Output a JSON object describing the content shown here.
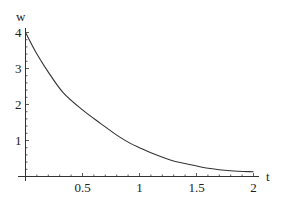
{
  "chart_data": {
    "type": "line",
    "title": "",
    "xlabel": "t",
    "ylabel": "w",
    "xlim": [
      0,
      2
    ],
    "ylim": [
      0,
      4
    ],
    "x_ticks": [
      {
        "value": 0.5,
        "label": "0.5"
      },
      {
        "value": 1,
        "label": "1"
      },
      {
        "value": 1.5,
        "label": "1.5"
      },
      {
        "value": 2,
        "label": "2"
      }
    ],
    "y_ticks": [
      {
        "value": 1,
        "label": "1"
      },
      {
        "value": 2,
        "label": "2"
      },
      {
        "value": 3,
        "label": "3"
      },
      {
        "value": 4,
        "label": "4"
      }
    ],
    "grid": false,
    "legend": null,
    "series": [
      {
        "name": "w(t)",
        "color": "#333333",
        "x": [
          0,
          0.1,
          0.2,
          0.33,
          0.5,
          0.66,
          0.8,
          0.92,
          1.0,
          1.1,
          1.27,
          1.4,
          1.62,
          1.8,
          2.0
        ],
        "y": [
          4.0,
          3.4,
          2.9,
          2.33,
          1.85,
          1.47,
          1.15,
          0.92,
          0.8,
          0.66,
          0.46,
          0.36,
          0.22,
          0.16,
          0.13
        ]
      }
    ]
  }
}
